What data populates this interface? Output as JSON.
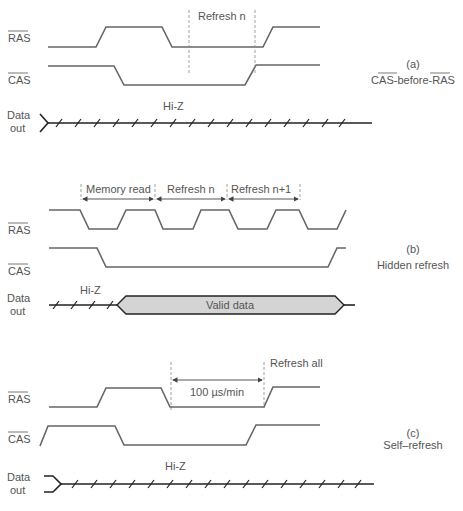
{
  "panels": [
    {
      "id": "a",
      "caption_letter": "(a)",
      "caption_title": "CAS-before-RAS",
      "signals": {
        "ras": "RAS",
        "cas": "CAS",
        "data_line1": "Data",
        "data_line2": "out"
      },
      "annotations": {
        "refresh": "Refresh n",
        "hiz": "Hi-Z"
      }
    },
    {
      "id": "b",
      "caption_letter": "(b)",
      "caption_title": "Hidden refresh",
      "signals": {
        "ras": "RAS",
        "cas": "CAS",
        "data_line1": "Data",
        "data_line2": "out"
      },
      "annotations": {
        "interval1": "Memory read",
        "interval2": "Refresh n",
        "interval3": "Refresh n+1",
        "hiz": "Hi-Z",
        "valid": "Valid data"
      },
      "colors": {
        "valid_fill": "#d4d4d4"
      }
    },
    {
      "id": "c",
      "caption_letter": "(c)",
      "caption_title": "Self–refresh",
      "signals": {
        "ras": "RAS",
        "cas": "CAS",
        "data_line1": "Data",
        "data_line2": "out"
      },
      "annotations": {
        "refresh_all": "Refresh all",
        "duration": "100 µs/min",
        "hiz": "Hi-Z"
      }
    }
  ]
}
